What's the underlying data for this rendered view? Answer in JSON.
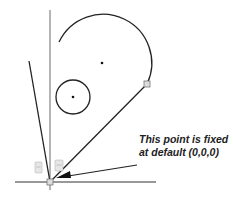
{
  "annotation": {
    "line1": "This point is fixed",
    "line2": "at default (0,0,0)"
  },
  "constraint_icons": {
    "left": "constraint-glyph",
    "right": "constraint-glyph"
  },
  "colors": {
    "stroke": "#222222",
    "point_fill": "#dcdcdc",
    "point_stroke": "#777777"
  }
}
